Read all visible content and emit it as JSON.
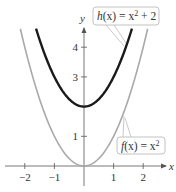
{
  "chart_data": {
    "type": "line",
    "title": "",
    "xlabel": "x",
    "ylabel": "y",
    "xlim": [
      -2.7,
      2.9
    ],
    "ylim": [
      -0.6,
      4.7
    ],
    "x_ticks": [
      -2,
      -1,
      1,
      2
    ],
    "x_tick_labels": [
      "−2",
      "−1",
      "1",
      "2"
    ],
    "y_ticks": [
      1,
      3,
      4
    ],
    "y_tick_labels": [
      "1",
      "3",
      "4"
    ],
    "grid": false,
    "series": [
      {
        "name": "f(x) = x^2",
        "label": "f(x) = x²",
        "color": "#a9a9a9",
        "width": 1.6,
        "expr": "x^2",
        "x": [
          -2.15,
          -2,
          -1.5,
          -1,
          -0.5,
          0,
          0.5,
          1,
          1.5,
          2,
          2.15
        ],
        "values": [
          4.62,
          4,
          2.25,
          1,
          0.25,
          0,
          0.25,
          1,
          2.25,
          4,
          4.62
        ]
      },
      {
        "name": "h(x) = x^2 + 2",
        "label": "h(x) = x² + 2",
        "color": "#1a1a1a",
        "width": 2.4,
        "expr": "x^2 + 2",
        "x": [
          -1.62,
          -1.5,
          -1,
          -0.5,
          0,
          0.5,
          1,
          1.5,
          1.62
        ],
        "values": [
          4.62,
          4.25,
          3,
          2.25,
          2,
          2.25,
          3,
          4.25,
          4.62
        ]
      }
    ],
    "annotations": [
      {
        "text": "h(x) = x² + 2",
        "points_to": "h upper right branch"
      },
      {
        "text": "f(x) = x²",
        "points_to": "f right branch"
      }
    ]
  },
  "labels": {
    "x_axis": "x",
    "y_axis": "y",
    "h_callout": {
      "name": "h",
      "arg": "(x) = x",
      "exp": "2",
      "tail": " + 2"
    },
    "f_callout": {
      "name": "f",
      "arg": "(x) = x",
      "exp": "2"
    }
  },
  "colors": {
    "f": "#a9a9a9",
    "h": "#1a1a1a",
    "axis": "#555555",
    "callout_border": "#bbbbbb"
  }
}
